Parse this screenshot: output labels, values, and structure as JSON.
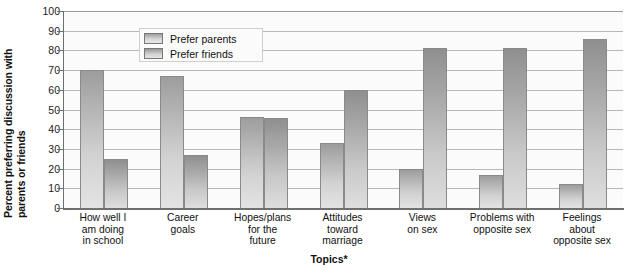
{
  "chart_data": {
    "type": "bar",
    "title": "",
    "xlabel": "Topics*",
    "ylabel": "Percent preferring discussion with parents or friends",
    "ylabel_line1": "Percent preferring discussion with",
    "ylabel_line2": "parents or friends",
    "ylim": [
      0,
      100
    ],
    "yticks": [
      100,
      90,
      80,
      70,
      60,
      50,
      40,
      30,
      20,
      10,
      0
    ],
    "grid": true,
    "legend_position": "top-left",
    "categories": [
      "How well I am doing in school",
      "Career goals",
      "Hopes/plans for the future",
      "Attitudes toward marriage",
      "Views on sex",
      "Problems with opposite sex",
      "Feelings about opposite sex"
    ],
    "category_lines": [
      [
        "How well I",
        "am doing",
        "in school"
      ],
      [
        "Career",
        "goals"
      ],
      [
        "Hopes/plans",
        "for the",
        "future"
      ],
      [
        "Attitudes",
        "toward",
        "marriage"
      ],
      [
        "Views",
        "on sex"
      ],
      [
        "Problems with",
        "opposite sex"
      ],
      [
        "Feelings",
        "about",
        "opposite sex"
      ]
    ],
    "series": [
      {
        "name": "Prefer parents",
        "color": "#c4c4c4",
        "values": [
          70,
          67,
          46,
          33,
          20,
          17,
          12
        ]
      },
      {
        "name": "Prefer friends",
        "color": "#bdbdbd",
        "values": [
          25,
          27,
          45.5,
          60,
          81,
          81,
          86
        ]
      }
    ]
  },
  "legend": {
    "items": [
      {
        "label": "Prefer parents"
      },
      {
        "label": "Prefer friends"
      }
    ]
  },
  "axes": {
    "x_title": "Topics*",
    "y_title_line1": "Percent preferring discussion with",
    "y_title_line2": "parents or friends"
  }
}
